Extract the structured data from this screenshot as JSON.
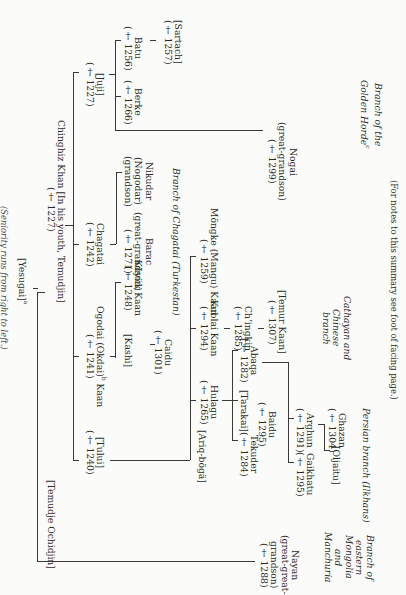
{
  "header": {
    "note": "(Seniority runs from right to left.)"
  },
  "root": {
    "name": "[Yesugai]",
    "footnote": "a"
  },
  "generation1": [
    {
      "id": "chinghiz",
      "name": "Chinghiz Khan [In his youth, Temudjin]",
      "death": "(† 1227)"
    },
    {
      "id": "temudje",
      "name": "[Temudje Ochidjin]"
    }
  ],
  "sons": [
    {
      "id": "juji",
      "name": "[Juji]",
      "death": "(† 1227)"
    },
    {
      "id": "chagatai",
      "name": "Chagatai",
      "death": "(† 1242)"
    },
    {
      "id": "ogodai",
      "name": "Ogodai (Okdai)",
      "footnote": "b",
      "title": "Kaan",
      "death": "(† 1241)"
    },
    {
      "id": "tului",
      "name": "[Tului]",
      "death": "(† 1240)"
    }
  ],
  "juji_line": [
    {
      "id": "batu",
      "name": "Batu",
      "death": "(† 1256)"
    },
    {
      "id": "sartach",
      "name": "[Sartach]",
      "death": "(† 1257)"
    },
    {
      "id": "berke",
      "name": "Berke",
      "death": "(† 1266)"
    },
    {
      "id": "nogai",
      "name": "Nogai",
      "relation": "(great-grandson)",
      "death": "(† 1299)"
    }
  ],
  "chagatai_line": [
    {
      "id": "nikudar",
      "name": "Nikudar",
      "alt": "(Nogodar)",
      "relation": "(grandson)"
    },
    {
      "id": "barac",
      "name": "Barac",
      "relation": "(great-grandson)",
      "death": "(† 1271)"
    }
  ],
  "ogodai_line": [
    {
      "id": "kuyuk",
      "name": "Küyük Kaan",
      "death": "(† 1248)"
    },
    {
      "id": "kashi",
      "name": "[Kashi]"
    },
    {
      "id": "caidu",
      "name": "Caidu",
      "death": "(† 1301)"
    }
  ],
  "tului_line": [
    {
      "id": "mongke",
      "name": "Möngke (Mangu) Kaan",
      "death": "(† 1259)"
    },
    {
      "id": "kublai",
      "name": "Kublai Kaan",
      "death": "(† 1294)"
    },
    {
      "id": "chingkin",
      "name": "Ch’ingkin",
      "death": "(† 1285)"
    },
    {
      "id": "temur",
      "name": "[Temur Kaan]",
      "death": "(† 1307)"
    },
    {
      "id": "hulagu",
      "name": "Hulagu",
      "death": "(† 1265)"
    },
    {
      "id": "ariqboga",
      "name": "[Ariq-bögä]"
    }
  ],
  "hulagu_line": [
    {
      "id": "abaqa",
      "name": "Abaqa",
      "death": "(† 1282)"
    },
    {
      "id": "tarakai",
      "name": "[Tarakai]"
    },
    {
      "id": "baidu",
      "name": "Baidu",
      "death": "(† 1295)"
    },
    {
      "id": "tekuder",
      "name": "Tekuder",
      "death": "(† 1284)"
    },
    {
      "id": "arghun",
      "name": "Arghun",
      "death": "(† 1291)"
    },
    {
      "id": "gaikhatu",
      "name": "Gaikhatu",
      "death": "(† 1295)"
    },
    {
      "id": "ghazan",
      "name": "Ghazan",
      "death": "(† 1304)"
    },
    {
      "id": "oljaitu",
      "name": "[Oljaitu]"
    }
  ],
  "temudje_line": [
    {
      "id": "nayan",
      "name": "Nayan",
      "relation1": "(great-great-",
      "relation2": "grandson)",
      "death": "(† 1288)"
    }
  ],
  "branches": {
    "golden_horde": [
      "Branch of the",
      "Golden Horde"
    ],
    "golden_horde_fn": "c",
    "chagatai": "Branch of Chagatai (Turkestan)",
    "cathayan": [
      "Cathayan and",
      "Chinese",
      "branch"
    ],
    "persian": "Persian branch (Ilkhans)",
    "eastern": [
      "Branch of",
      "eastern",
      "Mongolia",
      "and",
      "Manchuria"
    ]
  },
  "footer": {
    "note": "(For notes to this summary see foot of facing page.)"
  }
}
